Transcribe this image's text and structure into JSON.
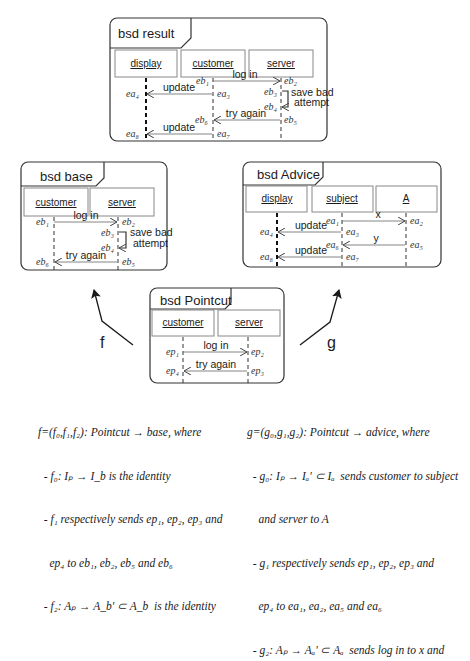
{
  "frames": {
    "result": {
      "title": "bsd result",
      "lifelines": [
        "display",
        "customer",
        "server"
      ],
      "events": {
        "eb1": "eb₁",
        "eb2": "eb₂",
        "eb3": "eb₃",
        "eb4": "eb₄",
        "eb5": "eb₅",
        "eb6": "eb₆",
        "ea3": "ea₃",
        "ea4": "ea₄",
        "ea7": "ea₇",
        "ea8": "ea₈"
      },
      "messages": {
        "login": "log in",
        "update1": "update",
        "save1": "save bad",
        "save2": "attempt",
        "try": "try again",
        "update2": "update"
      }
    },
    "base": {
      "title": "bsd base",
      "lifelines": [
        "customer",
        "server"
      ],
      "events": {
        "eb1": "eb₁",
        "eb2": "eb₂",
        "eb3": "eb₃",
        "eb4": "eb₄",
        "eb5": "eb₅",
        "eb6": "eb₆"
      },
      "messages": {
        "login": "log in",
        "save1": "save bad",
        "save2": "attempt",
        "try": "try again"
      }
    },
    "advice": {
      "title": "bsd Advice",
      "lifelines": [
        "display",
        "subject",
        "A"
      ],
      "events": {
        "ea1": "ea₁",
        "ea2": "ea₂",
        "ea3": "ea₃",
        "ea4": "ea₄",
        "ea5": "ea₅",
        "ea6": "ea₆",
        "ea7": "ea₇",
        "ea8": "ea₈"
      },
      "messages": {
        "x": "x",
        "update1": "update",
        "y": "y",
        "update2": "update"
      }
    },
    "pointcut": {
      "title": "bsd Pointcut",
      "lifelines": [
        "customer",
        "server"
      ],
      "events": {
        "ep1": "ep₁",
        "ep2": "ep₂",
        "ep3": "ep₃",
        "ep4": "ep₄"
      },
      "messages": {
        "login": "log in",
        "try": "try again"
      }
    }
  },
  "morphisms": {
    "f": "f",
    "g": "g"
  },
  "captions": {
    "f": [
      "f=(f₀,f₁,f₂): Pointcut → base, where",
      "  - f₀: Iₚ → I_b is the identity",
      "  - f₁ respectively sends ep₁, ep₂, ep₃ and",
      "    ep₄ to eb₁, eb₂, eb₅ and eb₆",
      "  - f₂: Aₚ → A_b' ⊂ A_b  is the identity"
    ],
    "g": [
      "g=(g₀,g₁,g₂): Pointcut → advice, where",
      "  - g₀: Iₚ → Iₐ' ⊂ Iₐ  sends customer to subject",
      "    and server to A",
      "  - g₁ respectively sends ep₁, ep₂, ep₃ and",
      "    ep₄ to ea₁, ea₂, ea₅ and ea₆",
      "  - g₂: Aₚ → Aₐ' ⊂ Aₐ  sends log in to x and"
    ]
  }
}
